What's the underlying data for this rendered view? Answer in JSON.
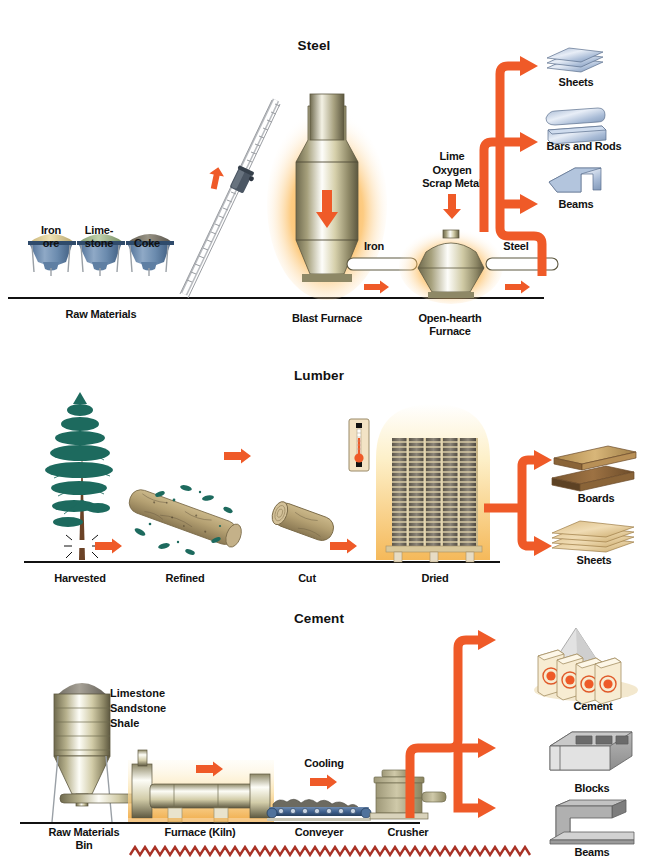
{
  "page": {
    "top_cut_text": "",
    "accent_orange": "#ef5a28",
    "zigzag_color": "#a93226",
    "bg": "#ffffff"
  },
  "sections": [
    {
      "id": "steel",
      "title": "Steel",
      "inputs_caption": "Raw Materials",
      "raw_materials": [
        {
          "label_line1": "Iron",
          "label_line2": "ore",
          "pile_color": "#e8d79a"
        },
        {
          "label_line1": "Lime-",
          "label_line2": "stone",
          "pile_color": "#a9bf96"
        },
        {
          "label_line1": "Coke",
          "label_line2": "",
          "pile_color": "#7e7a6d"
        }
      ],
      "stages": [
        {
          "name": "Blast Furnace"
        },
        {
          "name": "Open-hearth",
          "name2": "Furnace"
        }
      ],
      "flow_labels": [
        "Iron",
        "Steel"
      ],
      "additives": [
        "Lime",
        "Oxygen",
        "Scrap Metal"
      ],
      "products": [
        "Sheets",
        "Bars and Rods",
        "Beams"
      ]
    },
    {
      "id": "lumber",
      "title": "Lumber",
      "stages": [
        {
          "name": "Harvested"
        },
        {
          "name": "Refined"
        },
        {
          "name": "Cut"
        },
        {
          "name": "Dried"
        }
      ],
      "products": [
        "Boards",
        "Sheets"
      ]
    },
    {
      "id": "cement",
      "title": "Cement",
      "bin_caption_line1": "Raw Materials",
      "bin_caption_line2": "Bin",
      "bin_contents": [
        "Limestone",
        "Sandstone",
        "Shale"
      ],
      "stages": [
        {
          "name": "Furnace (Kiln)"
        },
        {
          "name": "Conveyer"
        },
        {
          "name": "Crusher"
        }
      ],
      "process_labels": [
        "Cooling"
      ],
      "products": [
        "Cement",
        "Blocks",
        "Beams"
      ]
    }
  ]
}
